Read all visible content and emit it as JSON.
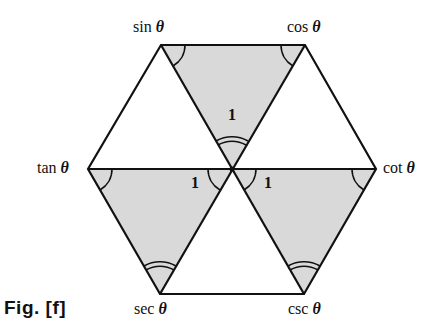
{
  "figure": {
    "caption": "Fig. [f]",
    "theta": "θ",
    "vertices": {
      "sin": {
        "name": "sin",
        "x": 161,
        "y": 45
      },
      "cos": {
        "name": "cos",
        "x": 305,
        "y": 45
      },
      "tan": {
        "name": "tan",
        "x": 88,
        "y": 169
      },
      "cot": {
        "name": "cot",
        "x": 376,
        "y": 169
      },
      "sec": {
        "name": "sec",
        "x": 160,
        "y": 294
      },
      "csc": {
        "name": "csc",
        "x": 304,
        "y": 294
      }
    },
    "center": {
      "x": 232,
      "y": 169
    },
    "center_label": "1",
    "shaded_triangles": [
      [
        "sin",
        "cos",
        "center"
      ],
      [
        "tan",
        "center",
        "sec"
      ],
      [
        "center",
        "cot",
        "csc"
      ]
    ],
    "unit_labels": [
      "1",
      "1",
      "1"
    ],
    "colors": {
      "line": "#111111",
      "shade": "#d9d9d9",
      "background": "#ffffff"
    }
  }
}
